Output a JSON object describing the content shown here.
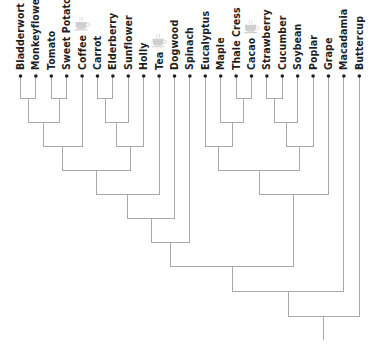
{
  "diagram": {
    "type": "phylogenetic-tree",
    "orientation": "root-bottom, leaves-top",
    "colors": {
      "edge": "#a9a9a9",
      "leaf_dot": "#222222",
      "label": "#1e1e1e",
      "caffeine_icon": "#cfcfcf"
    },
    "leaves": [
      {
        "id": 0,
        "label": "Bladderwort",
        "caffeine": false
      },
      {
        "id": 1,
        "label": "Monkeyflower",
        "caffeine": false
      },
      {
        "id": 2,
        "label": "Tomato",
        "caffeine": false
      },
      {
        "id": 3,
        "label": "Sweet Potato",
        "caffeine": false
      },
      {
        "id": 4,
        "label": "Coffee",
        "caffeine": true
      },
      {
        "id": 5,
        "label": "Carrot",
        "caffeine": false
      },
      {
        "id": 6,
        "label": "Elderberry",
        "caffeine": false
      },
      {
        "id": 7,
        "label": "Sunflower",
        "caffeine": false
      },
      {
        "id": 8,
        "label": "Holly",
        "caffeine": false
      },
      {
        "id": 9,
        "label": "Tea",
        "caffeine": true
      },
      {
        "id": 10,
        "label": "Dogwood",
        "caffeine": false
      },
      {
        "id": 11,
        "label": "Spinach",
        "caffeine": false
      },
      {
        "id": 12,
        "label": "Eucalyptus",
        "caffeine": false
      },
      {
        "id": 13,
        "label": "Maple",
        "caffeine": false
      },
      {
        "id": 14,
        "label": "Thale Cress",
        "caffeine": false
      },
      {
        "id": 15,
        "label": "Cacao",
        "caffeine": true
      },
      {
        "id": 16,
        "label": "Strawberry",
        "caffeine": false
      },
      {
        "id": 17,
        "label": "Cucumber",
        "caffeine": false
      },
      {
        "id": 18,
        "label": "Soybean",
        "caffeine": false
      },
      {
        "id": 19,
        "label": "Poplar",
        "caffeine": false
      },
      {
        "id": 20,
        "label": "Grape",
        "caffeine": false
      },
      {
        "id": 21,
        "label": "Macadamia",
        "caffeine": false
      },
      {
        "id": 22,
        "label": "Buttercup",
        "caffeine": false
      }
    ],
    "newick": "((((((((((Bladderwort,Monkeyflower),(Tomato,Sweet Potato)),Coffee),(((Carrot,Elderberry),Sunflower),Holly)),Tea),Dogwood),Spinach),(((Eucalyptus,(Maple,(Thale Cress,Cacao))),(((Strawberry,Cucumber),Soybean),Poplar)),Grape)),Macadamia),Buttercup);",
    "icon": "coffee-cup-icon"
  }
}
